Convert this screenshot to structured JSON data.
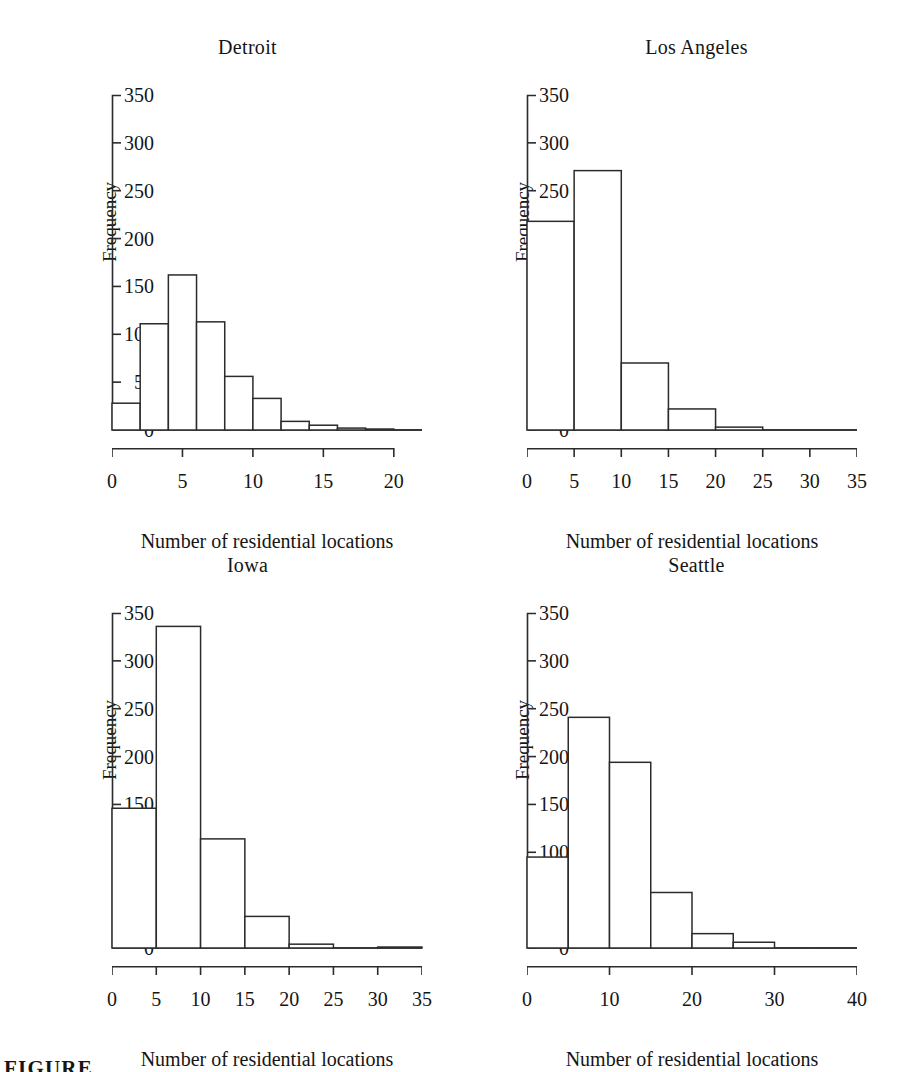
{
  "figure": {
    "caption_partial": "FIGURE",
    "y_axis_label": "Frequency",
    "x_axis_label": "Number of residential locations",
    "axis_color": "#2b2b2b",
    "bar_outline_color": "#2b2b2b",
    "bar_fill_color": "#ffffff",
    "background_color": "#ffffff"
  },
  "chart_data": [
    {
      "type": "bar",
      "title": "Detroit",
      "xlabel": "Number of residential locations",
      "ylabel": "Frequency",
      "ylim": [
        0,
        350
      ],
      "xlim": [
        0,
        22
      ],
      "yticks": [
        0,
        50,
        100,
        150,
        200,
        250,
        300,
        350
      ],
      "xticks": [
        0,
        5,
        10,
        15,
        20
      ],
      "bin_width": 2,
      "bin_edges": [
        0,
        2,
        4,
        6,
        8,
        10,
        12,
        14,
        16,
        18,
        20,
        22
      ],
      "categories": [
        "0-2",
        "2-4",
        "4-6",
        "6-8",
        "8-10",
        "10-12",
        "12-14",
        "14-16",
        "16-18",
        "18-20",
        "20-22"
      ],
      "values": [
        28,
        111,
        162,
        113,
        56,
        33,
        9,
        5,
        2,
        1,
        0
      ],
      "grid": false,
      "legend": "none"
    },
    {
      "type": "bar",
      "title": "Los Angeles",
      "xlabel": "Number of residential locations",
      "ylabel": "Frequency",
      "ylim": [
        0,
        350
      ],
      "xlim": [
        0,
        35
      ],
      "yticks": [
        0,
        50,
        100,
        150,
        200,
        250,
        300,
        350
      ],
      "xticks": [
        0,
        5,
        10,
        15,
        20,
        25,
        30,
        35
      ],
      "bin_width": 5,
      "bin_edges": [
        0,
        5,
        10,
        15,
        20,
        25,
        30,
        35
      ],
      "categories": [
        "0-5",
        "5-10",
        "10-15",
        "15-20",
        "20-25",
        "25-30",
        "30-35"
      ],
      "values": [
        218,
        271,
        70,
        22,
        3,
        0,
        0
      ],
      "grid": false,
      "legend": "none"
    },
    {
      "type": "bar",
      "title": "Iowa",
      "xlabel": "Number of residential locations",
      "ylabel": "Frequency",
      "ylim": [
        0,
        350
      ],
      "xlim": [
        0,
        35
      ],
      "yticks": [
        0,
        50,
        100,
        150,
        200,
        250,
        300,
        350
      ],
      "xticks": [
        0,
        5,
        10,
        15,
        20,
        25,
        30,
        35
      ],
      "bin_width": 5,
      "bin_edges": [
        0,
        5,
        10,
        15,
        20,
        25,
        30,
        35
      ],
      "categories": [
        "0-5",
        "5-10",
        "10-15",
        "15-20",
        "20-25",
        "25-30",
        "30-35"
      ],
      "values": [
        146,
        336,
        114,
        33,
        4,
        0,
        1
      ],
      "grid": false,
      "legend": "none"
    },
    {
      "type": "bar",
      "title": "Seattle",
      "xlabel": "Number of residential locations",
      "ylabel": "Frequency",
      "ylim": [
        0,
        350
      ],
      "xlim": [
        0,
        40
      ],
      "yticks": [
        0,
        50,
        100,
        150,
        200,
        250,
        300,
        350
      ],
      "xticks": [
        0,
        10,
        20,
        30,
        40
      ],
      "bin_width": 5,
      "bin_edges": [
        0,
        5,
        10,
        15,
        20,
        25,
        30,
        35,
        40
      ],
      "categories": [
        "0-5",
        "5-10",
        "10-15",
        "15-20",
        "20-25",
        "25-30",
        "30-35",
        "35-40"
      ],
      "values": [
        95,
        241,
        194,
        58,
        15,
        6,
        0,
        0
      ],
      "grid": false,
      "legend": "none"
    }
  ]
}
